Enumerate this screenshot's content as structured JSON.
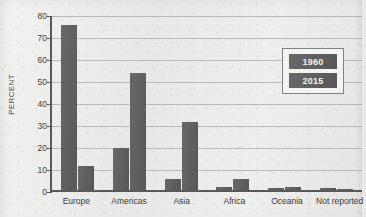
{
  "chart_data": {
    "type": "bar",
    "title": "",
    "xlabel": "",
    "ylabel": "PERCENT",
    "ylim": [
      0,
      80
    ],
    "grid": true,
    "legend_position": "upper right",
    "categories": [
      "Europe",
      "Americas",
      "Asia",
      "Africa",
      "Oceania",
      "Not reported"
    ],
    "y_ticks": [
      0,
      10,
      20,
      30,
      40,
      50,
      60,
      70,
      80
    ],
    "y_tick_labels": [
      "0",
      "10",
      "20",
      "30",
      "40",
      "50",
      "60",
      "70",
      "80"
    ],
    "series": [
      {
        "name": "1960",
        "values": [
          75,
          19,
          5,
          1.5,
          1,
          1
        ]
      },
      {
        "name": "2015",
        "values": [
          11,
          53,
          31,
          5,
          1.5,
          0.5
        ]
      }
    ],
    "colors": {
      "bar": "#5d5d5e",
      "legend_text": "#f4f4f2",
      "axis": "#59595a",
      "gridline": "#b9b9b6",
      "background": "#ececea"
    }
  },
  "legend": {
    "items": [
      {
        "label": "1960"
      },
      {
        "label": "2015"
      }
    ]
  }
}
